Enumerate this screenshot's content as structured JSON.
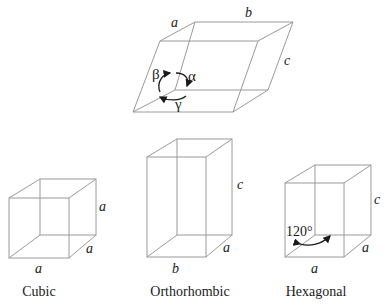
{
  "triclinic_cell": {
    "edge_labels": {
      "a": "a",
      "b": "b",
      "c": "c"
    },
    "angle_labels": {
      "alpha": "α",
      "beta": "β",
      "gamma": "γ"
    }
  },
  "cubic": {
    "caption": "Cubic",
    "edge_labels": {
      "height": "a",
      "depth": "a",
      "width": "a"
    }
  },
  "orthorhombic": {
    "caption": "Orthorhombic",
    "edge_labels": {
      "height": "c",
      "depth": "a",
      "width": "b"
    }
  },
  "hexagonal": {
    "caption": "Hexagonal",
    "edge_labels": {
      "height": "c",
      "depth": "a",
      "width": "a"
    },
    "angle_label": "120°"
  },
  "colors": {
    "edge": "#9a9a9a",
    "text": "#1a1a1a",
    "background": "#ffffff"
  }
}
